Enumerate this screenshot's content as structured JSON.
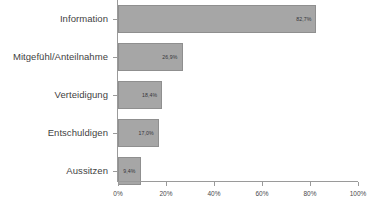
{
  "chart_data": {
    "type": "bar",
    "orientation": "horizontal",
    "title": "",
    "xlabel": "",
    "ylabel": "",
    "xlim": [
      0,
      100
    ],
    "grid": false,
    "legend": null,
    "categories": [
      "Information",
      "Mitgefühl/Anteilnahme",
      "Verteidigung",
      "Entschuldigen",
      "Aussitzen"
    ],
    "values": [
      82.7,
      26.9,
      18.4,
      17.0,
      9.4
    ],
    "value_labels": [
      "82,7%",
      "26,9%",
      "18,4%",
      "17,0%",
      "9,4%"
    ],
    "xticks": [
      0,
      20,
      40,
      60,
      80,
      100
    ],
    "xtick_labels": [
      "0%",
      "20%",
      "40%",
      "60%",
      "80%",
      "100%"
    ],
    "bar_color": "#a6a6a6",
    "bar_border_color": "#8f8f8f",
    "axis_color": "#9a9a9a",
    "label_color": "#3f3f3f",
    "background": "#ffffff"
  }
}
